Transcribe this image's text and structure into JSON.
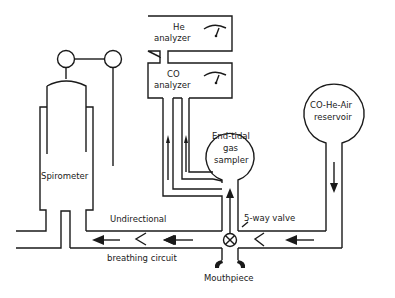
{
  "diagram": {
    "type": "apparatus-schematic",
    "colors": {
      "line": "#1a1a1a",
      "background": "#ffffff"
    },
    "labels": {
      "he_analyzer_1": "He",
      "he_analyzer_2": "analyzer",
      "co_analyzer_1": "CO",
      "co_analyzer_2": "analyzer",
      "sampler_1": "End-tidal",
      "sampler_2": "gas",
      "sampler_3": "sampler",
      "reservoir_1": "CO-He-Air",
      "reservoir_2": "reservoir",
      "spirometer": "Spirometer",
      "valve": "5-way valve",
      "circuit_1": "Undirectional",
      "circuit_2": "breathing circuit",
      "mouthpiece": "Mouthpiece"
    },
    "components": [
      {
        "id": "he-analyzer",
        "label": "He analyzer",
        "has_gauge": true
      },
      {
        "id": "co-analyzer",
        "label": "CO analyzer",
        "has_gauge": true
      },
      {
        "id": "end-tidal-gas-sampler",
        "label": "End-tidal gas sampler"
      },
      {
        "id": "co-he-air-reservoir",
        "label": "CO-He-Air reservoir"
      },
      {
        "id": "spirometer",
        "label": "Spirometer"
      },
      {
        "id": "five-way-valve",
        "label": "5-way valve"
      },
      {
        "id": "breathing-circuit",
        "label": "Undirectional breathing circuit"
      },
      {
        "id": "mouthpiece",
        "label": "Mouthpiece"
      }
    ]
  }
}
